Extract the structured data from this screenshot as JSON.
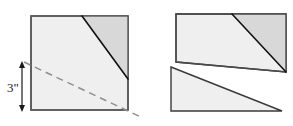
{
  "figure": {
    "type": "geometry-diagram",
    "units": "inches",
    "dimension_labels": [
      {
        "id": "height-3in",
        "text": "3\"",
        "orientation": "vertical",
        "measures": "distance from cut line to bottom edge of square"
      }
    ],
    "colors": {
      "body_fill": "#efefef",
      "shaded_fill": "#d8d8d8",
      "outline": "#3a3a3a",
      "cut_line": "#111111",
      "dashed_line": "#8a8a8a",
      "arrow": "#1a1a1a",
      "background": "#ffffff"
    },
    "left_figure": {
      "name": "original-square",
      "description": "Square with a solid diagonal cut in the upper right corner forming a shaded triangle, and a dashed line crossing from the left edge to beyond the lower right corner",
      "square": {
        "x": 31,
        "y": 16,
        "width": 97,
        "height": 94
      },
      "shaded_triangle_points": "82,16 128,16 128,79",
      "cut_line_points": "82,16 128,79",
      "dashed_line_points": "24,62 142,118",
      "arrow": {
        "x": 22,
        "y_top": 63,
        "y_bottom": 110
      },
      "label_position": {
        "x": 9,
        "y": 90
      }
    },
    "right_figure": {
      "name": "rearranged-pieces",
      "description": "The square cut into two pieces and slid apart: the upper piece shifted up-right and the lower piece shifted down-left, forming a parallelogram-like staircase",
      "upper_piece_points": "176,14 286,14 286,72 176,62",
      "upper_shaded_points": "232,14 286,14 286,72",
      "upper_cut_line_points": "232,14 286,72",
      "lower_piece_points": "171,67 281,110 281,111 171,111",
      "lower_piece_outline_points": "171,67 281,111 171,111"
    }
  }
}
